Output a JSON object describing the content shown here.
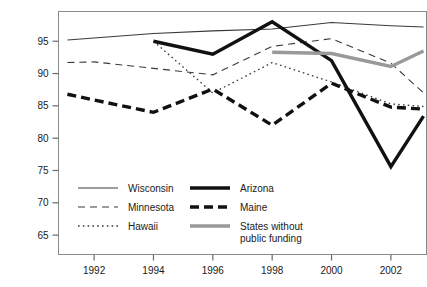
{
  "chart_data": {
    "type": "line",
    "title": "",
    "xlabel": "",
    "ylabel": "",
    "xlim": [
      1990.8,
      2003.2
    ],
    "ylim": [
      62.0,
      99.6
    ],
    "grid": false,
    "legend_position": "inside-bottom-left",
    "x_ticks": [
      1992,
      1994,
      1996,
      1998,
      2000,
      2002
    ],
    "x_tick_labels": [
      "1992",
      "1994",
      "1996",
      "1998",
      "2000",
      "2002"
    ],
    "y_ticks": [
      65,
      70,
      75,
      80,
      85,
      90,
      95
    ],
    "y_tick_labels": [
      "65",
      "70",
      "75",
      "80",
      "85",
      "90",
      "95"
    ],
    "series": [
      {
        "name": "Wisconsin",
        "style": "solid-thin",
        "color": "#3a3a3a",
        "x": [
          1991.1,
          1992,
          1994,
          1996,
          1998,
          2000,
          2002,
          2003.1
        ],
        "values": [
          95.2,
          95.5,
          96.2,
          96.6,
          96.9,
          97.9,
          97.4,
          97.2
        ]
      },
      {
        "name": "Minnesota",
        "style": "dashed-thin",
        "color": "#3a3a3a",
        "x": [
          1991.1,
          1992,
          1994,
          1996,
          1998,
          2000,
          2002,
          2003.1
        ],
        "values": [
          91.7,
          91.8,
          90.8,
          89.8,
          94.2,
          95.4,
          91.6,
          87.0
        ]
      },
      {
        "name": "Hawaii",
        "style": "dotted-thin",
        "color": "#3a3a3a",
        "x": [
          1994,
          1996,
          1998,
          2000,
          2002,
          2003.1
        ],
        "values": [
          95.0,
          87.0,
          91.7,
          88.7,
          85.3,
          84.9
        ]
      },
      {
        "name": "Arizona",
        "style": "solid-thick",
        "color": "#111111",
        "x": [
          1994,
          1996,
          1998,
          2000,
          2002,
          2003.1
        ],
        "values": [
          95.0,
          93.0,
          98.0,
          92.0,
          75.6,
          83.4
        ]
      },
      {
        "name": "Maine",
        "style": "dashed-thick",
        "color": "#111111",
        "x": [
          1991.1,
          1992,
          1994,
          1996,
          1998,
          2000,
          2002,
          2003.1
        ],
        "values": [
          86.8,
          85.9,
          84.0,
          87.6,
          82.0,
          88.5,
          84.8,
          84.5
        ]
      },
      {
        "name": "States without public funding",
        "style": "solid-thick-gray",
        "color": "#999999",
        "x": [
          1998,
          2000,
          2002,
          2003.1
        ],
        "values": [
          93.3,
          93.1,
          91.1,
          93.5
        ]
      }
    ]
  },
  "legend": {
    "entries": [
      {
        "label": "Wisconsin",
        "style": "solid-thin",
        "color": "#3a3a3a"
      },
      {
        "label": "Minnesota",
        "style": "dashed-thin",
        "color": "#3a3a3a"
      },
      {
        "label": "Hawaii",
        "style": "dotted-thin",
        "color": "#3a3a3a"
      },
      {
        "label": "Arizona",
        "style": "solid-thick",
        "color": "#111111"
      },
      {
        "label": "Maine",
        "style": "dashed-thick",
        "color": "#111111"
      },
      {
        "label": "States without",
        "label2": "public funding",
        "style": "solid-thick-gray",
        "color": "#999999"
      }
    ]
  },
  "axes": {
    "frame_color": "#8a8a8a",
    "tick_color": "#6a6a6a",
    "text_color": "#1a1a1a"
  }
}
